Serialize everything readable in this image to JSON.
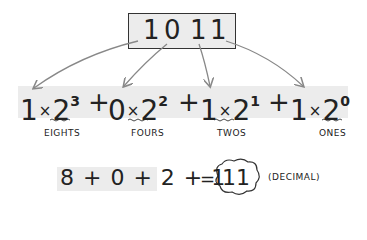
{
  "binary_number": {
    "value": "1011",
    "digits": [
      "1",
      "0",
      "1",
      "1"
    ]
  },
  "expansion": {
    "terms": [
      {
        "digit": "1",
        "times": "×",
        "base": "2",
        "exponent": "3",
        "label": "EIGHTS"
      },
      {
        "digit": "0",
        "times": "×",
        "base": "2",
        "exponent": "2",
        "label": "FOURS"
      },
      {
        "digit": "1",
        "times": "×",
        "base": "2",
        "exponent": "1",
        "label": "TWOS"
      },
      {
        "digit": "1",
        "times": "×",
        "base": "2",
        "exponent": "0",
        "label": "ONES"
      }
    ],
    "operator": "+"
  },
  "sum": {
    "expression": "8 + 0 + 2 + 1",
    "equals": "=",
    "result": "11",
    "result_note": "(DECIMAL)"
  },
  "colors": {
    "ink": "#222222",
    "highlight": "#ececec",
    "arrow": "#888888"
  }
}
